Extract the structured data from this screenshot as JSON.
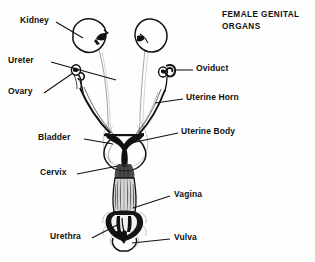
{
  "figure": {
    "title_line1": "FEMALE GENITAL",
    "title_line2": "ORGANS",
    "background_color": "#fefefe",
    "ink_color": "#111111"
  },
  "labels": [
    {
      "id": "kidney",
      "text": "Kidney",
      "side": "left"
    },
    {
      "id": "ureter",
      "text": "Ureter",
      "side": "left"
    },
    {
      "id": "ovary",
      "text": "Ovary",
      "side": "left"
    },
    {
      "id": "bladder",
      "text": "Bladder",
      "side": "left"
    },
    {
      "id": "cervix",
      "text": "Cervix",
      "side": "left"
    },
    {
      "id": "urethra",
      "text": "Urethra",
      "side": "left"
    },
    {
      "id": "oviduct",
      "text": "Oviduct",
      "side": "right"
    },
    {
      "id": "uterine-horn",
      "text": "Uterine Horn",
      "side": "right"
    },
    {
      "id": "uterine-body",
      "text": "Uterine Body",
      "side": "right"
    },
    {
      "id": "vagina",
      "text": "Vagina",
      "side": "right"
    },
    {
      "id": "vulva",
      "text": "Vulva",
      "side": "right"
    }
  ]
}
